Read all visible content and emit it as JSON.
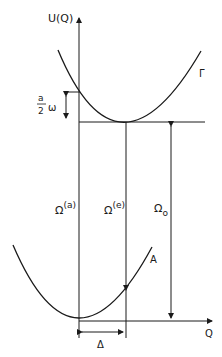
{
  "diagram": {
    "type": "potential-energy-curves",
    "axes": {
      "y_label": "U(Q)",
      "x_label": "Q"
    },
    "curves": [
      {
        "name": "upper-parabola",
        "label": "Γ"
      },
      {
        "name": "lower-parabola",
        "label": "A"
      }
    ],
    "annotations": {
      "half_omega_num": "a",
      "half_omega_den": "2",
      "half_omega_sym": "ω",
      "omega_a_base": "Ω",
      "omega_a_sup": "(a)",
      "omega_e_base": "Ω",
      "omega_e_sup": "(e)",
      "omega_0_base": "Ω",
      "omega_0_sub": "o",
      "delta": "Δ"
    },
    "colors": {
      "line": "#1a1a1a",
      "background": "#ffffff"
    }
  }
}
